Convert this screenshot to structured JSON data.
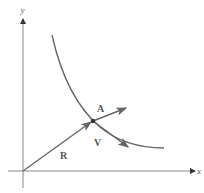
{
  "diagram": {
    "axes": {
      "x_label": "x",
      "y_label": "y"
    },
    "vectors": {
      "position": {
        "label": "R"
      },
      "acceleration": {
        "label": "A"
      },
      "velocity": {
        "label": "V"
      }
    },
    "colors": {
      "axis": "#888888",
      "curve": "#666666",
      "vector": "#666666",
      "label": "#555555"
    }
  }
}
